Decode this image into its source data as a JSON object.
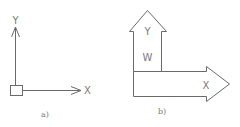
{
  "figure_a": {
    "caption": "a)",
    "y_axis_label": "Y",
    "x_axis_label": "X"
  },
  "figure_b": {
    "caption": "b)",
    "up_arrow_labels": [
      "Y",
      "W"
    ],
    "right_arrow_label": "X"
  },
  "colors": {
    "line": "#6a6a6a",
    "text": "#7a7a7a",
    "background": "#ffffff"
  }
}
